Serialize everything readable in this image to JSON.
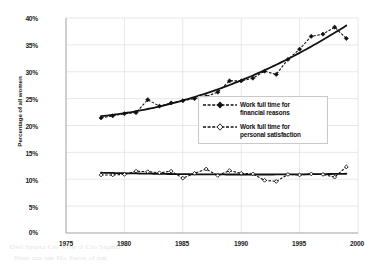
{
  "chart_data": {
    "type": "line",
    "title": "",
    "subtitle": "",
    "xlabel": "",
    "ylabel": "Percentage of all women",
    "xlim": [
      1975,
      2000
    ],
    "ylim": [
      0,
      40
    ],
    "grid": true,
    "x_ticks": [
      "1975",
      "1980",
      "1985",
      "1990",
      "1995",
      "2000"
    ],
    "y_ticks": [
      "0%",
      "5%",
      "10%",
      "15%",
      "20%",
      "25%",
      "30%",
      "35%",
      "40%"
    ],
    "legend_position": "center-right",
    "series": [
      {
        "name": "Work full time for financial reasons",
        "marker": "filled-diamond",
        "line_style": "dashed",
        "has_trend_line": true,
        "x": [
          1978,
          1979,
          1980,
          1981,
          1982,
          1983,
          1984,
          1985,
          1986,
          1987,
          1988,
          1989,
          1990,
          1991,
          1992,
          1993,
          1994,
          1995,
          1996,
          1997,
          1998,
          1999
        ],
        "values": [
          21.4,
          21.8,
          22.2,
          22.4,
          24.8,
          23.6,
          24.2,
          24.6,
          25.0,
          25.4,
          26.2,
          28.3,
          28.3,
          28.8,
          30.1,
          29.5,
          32.3,
          34.2,
          36.6,
          37.0,
          38.3,
          36.2
        ]
      },
      {
        "name": "Work full time for personal satisfaction",
        "marker": "open-diamond",
        "line_style": "dashed",
        "has_trend_line": true,
        "x": [
          1978,
          1979,
          1980,
          1981,
          1982,
          1983,
          1984,
          1985,
          1986,
          1987,
          1988,
          1989,
          1990,
          1991,
          1992,
          1993,
          1994,
          1995,
          1996,
          1997,
          1998,
          1999
        ],
        "values": [
          10.8,
          10.8,
          10.9,
          11.5,
          11.4,
          11.2,
          11.5,
          10.2,
          11.1,
          11.9,
          10.7,
          11.6,
          11.1,
          11.0,
          9.8,
          9.6,
          10.9,
          10.8,
          11.0,
          10.9,
          10.4,
          12.3
        ]
      }
    ]
  },
  "legend": {
    "items": [
      {
        "label": "Work full time for\nfinancial reasons",
        "marker": "filled-diamond"
      },
      {
        "label": "Work full time for\npersonal satisfaction",
        "marker": "open-diamond"
      }
    ]
  },
  "colors": {
    "line": "#111111",
    "grid": "#d8d8d8",
    "text": "#1a1a1a",
    "background": "#ffffff"
  },
  "bleed_through": {
    "line1": "Owl Sparta Cto Vttw il  Cto Siqmri",
    "line2": "Nnur rzn     om  Mo Swon  ol  nm"
  }
}
